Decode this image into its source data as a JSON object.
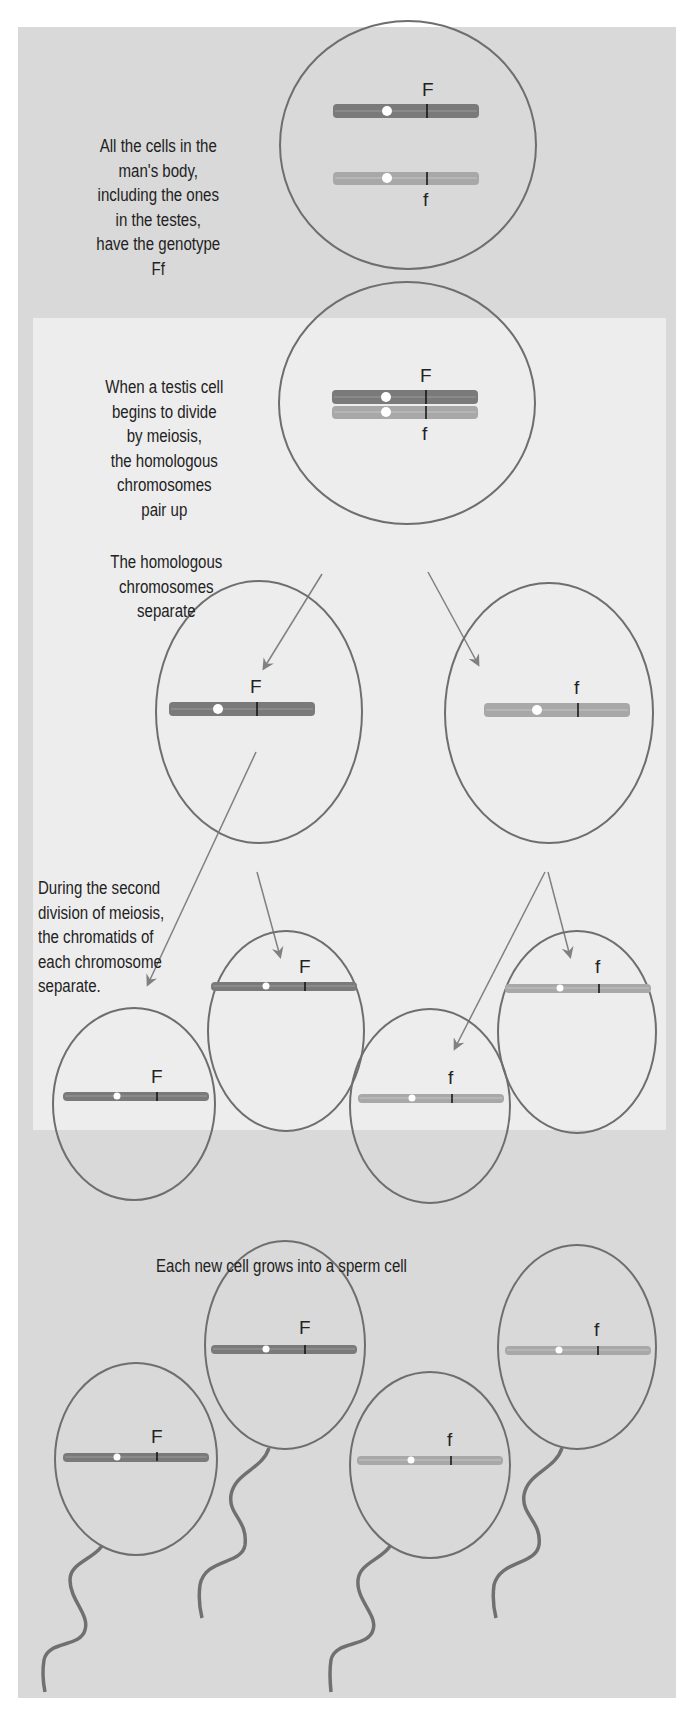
{
  "colors": {
    "outer_bg": "#d9d9d9",
    "inner_bg": "#ededed",
    "cell_outline": "#6e6e6e",
    "chromosome_dominant": "#7a7a7a",
    "chromosome_recessive": "#a8a8a8",
    "arrow": "#808080",
    "tail": "#707070"
  },
  "sections": {
    "somatic": {
      "caption": "All the cells in the\nman's body,\nincluding the ones\nin the testes,\nhave the genotype\nFf",
      "cell": {
        "alleles": [
          "F",
          "f"
        ]
      }
    },
    "meiosis": {
      "pairing_caption": "When a testis cell\nbegins to divide\nby meiosis,\nthe homologous\nchromosomes\npair up",
      "separate_caption": "The homologous\nchromosomes\nseparate",
      "second_division_caption": "During the second\ndivision of meiosis,\nthe chromatids of\neach chromosome\nseparate.",
      "paired_cell": {
        "alleles": [
          "F",
          "f"
        ]
      },
      "first_division_cells": [
        {
          "allele": "F"
        },
        {
          "allele": "f"
        }
      ],
      "second_division_cells": [
        {
          "allele": "F"
        },
        {
          "allele": "F"
        },
        {
          "allele": "f"
        },
        {
          "allele": "f"
        }
      ]
    },
    "sperm": {
      "caption": "Each new cell grows into a sperm cell",
      "cells": [
        {
          "allele": "F"
        },
        {
          "allele": "F"
        },
        {
          "allele": "f"
        },
        {
          "allele": "f"
        }
      ]
    }
  }
}
